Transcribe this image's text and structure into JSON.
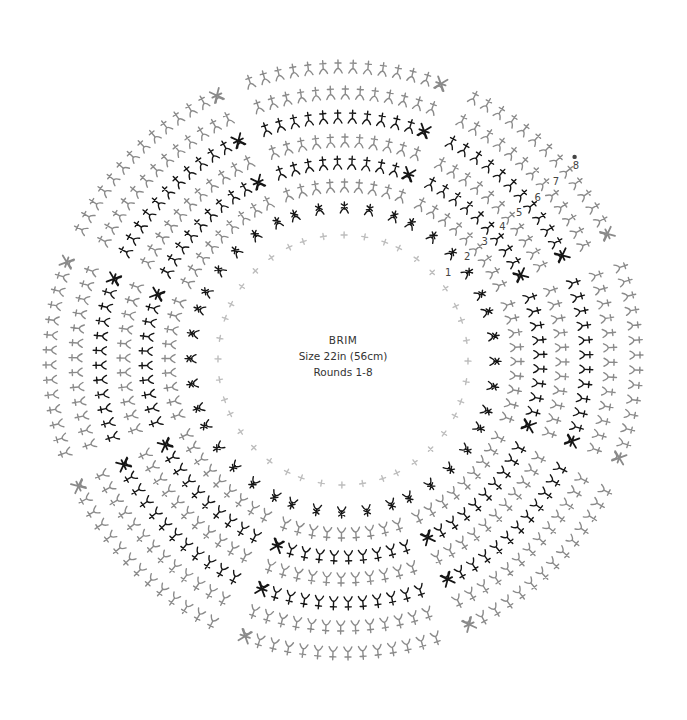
{
  "title": "BRIM",
  "size": "Size 22in (56cm)",
  "rounds_caption": "Rounds 1-8",
  "colors": {
    "black": "#151515",
    "gray": "#8a8a8a",
    "light": "#bdbdbd",
    "label": "#444444"
  },
  "start_marker": "dot",
  "sectors": 8,
  "rounds": [
    {
      "number": "1",
      "stitch": "chain-plus",
      "shade": "light",
      "per_sector": 5
    },
    {
      "number": "2",
      "stitch": "cluster-star",
      "shade": "black",
      "per_sector": 5
    },
    {
      "number": "3",
      "stitch": "post-stitch",
      "shade": "gray",
      "per_sector": 9
    },
    {
      "number": "4",
      "stitch": "post-stitch",
      "shade": "black",
      "per_sector": 10
    },
    {
      "number": "5",
      "stitch": "post-stitch",
      "shade": "gray",
      "per_sector": 11
    },
    {
      "number": "6",
      "stitch": "post-stitch",
      "shade": "black",
      "per_sector": 12
    },
    {
      "number": "7",
      "stitch": "post-stitch",
      "shade": "gray",
      "per_sector": 13
    },
    {
      "number": "8",
      "stitch": "post-stitch",
      "shade": "gray",
      "per_sector": 14
    }
  ]
}
